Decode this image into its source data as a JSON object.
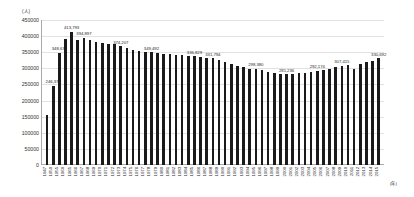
{
  "chart_data": {
    "type": "bar",
    "title": "",
    "xlabel": "(年)",
    "ylabel": "(人)",
    "ylim": [
      0,
      450000
    ],
    "ytick_step": 50000,
    "yticks": [
      0,
      50000,
      100000,
      150000,
      200000,
      250000,
      300000,
      350000,
      400000,
      450000
    ],
    "ytick_labels": [
      "0",
      "50000",
      "100000",
      "150000",
      "200000",
      "250000",
      "300000",
      "350000",
      "400000",
      "450000"
    ],
    "grid": true,
    "legend": "none",
    "bar_color": "#1a1a1a",
    "categories": [
      "1947",
      "1950",
      "1955",
      "1960",
      "1965",
      "1966",
      "1967",
      "1968",
      "1969",
      "1970",
      "1971",
      "1972",
      "1973",
      "1974",
      "1975",
      "1976",
      "1977",
      "1978",
      "1979",
      "1980",
      "1981",
      "1982",
      "1983",
      "1984",
      "1985",
      "1986",
      "1987",
      "1988",
      "1989",
      "1990",
      "1991",
      "1992",
      "1993",
      "1994",
      "1995",
      "1996",
      "1997",
      "1998",
      "1999",
      "2000",
      "2001",
      "2002",
      "2003",
      "2004",
      "2005",
      "2006",
      "2007",
      "2008",
      "2009",
      "2010",
      "2011",
      "2012",
      "2013",
      "2014",
      "2015"
    ],
    "values": [
      155000,
      246373,
      348675,
      390000,
      413793,
      388000,
      394897,
      388000,
      382000,
      380000,
      377000,
      374207,
      368000,
      363000,
      358000,
      355000,
      352000,
      349492,
      347000,
      345000,
      343000,
      341000,
      340000,
      339000,
      336829,
      334000,
      332000,
      331794,
      327000,
      320000,
      313000,
      307000,
      303000,
      299000,
      298380,
      294000,
      290000,
      286000,
      283000,
      281236,
      283000,
      285000,
      287000,
      290000,
      292174,
      295000,
      299000,
      303000,
      307415,
      310000,
      298000,
      315000,
      320000,
      324000,
      330692
    ],
    "point_labels": [
      {
        "index": 1,
        "text": "246,373"
      },
      {
        "index": 2,
        "text": "348,675"
      },
      {
        "index": 4,
        "text": "413,793"
      },
      {
        "index": 6,
        "text": "394,897"
      },
      {
        "index": 12,
        "text": "374,207"
      },
      {
        "index": 17,
        "text": "349,492"
      },
      {
        "index": 24,
        "text": "336,829"
      },
      {
        "index": 27,
        "text": "331,794"
      },
      {
        "index": 34,
        "text": "298,380"
      },
      {
        "index": 39,
        "text": "281,236"
      },
      {
        "index": 44,
        "text": "292,174"
      },
      {
        "index": 48,
        "text": "307,415"
      },
      {
        "index": 54,
        "text": "330,692"
      }
    ]
  }
}
